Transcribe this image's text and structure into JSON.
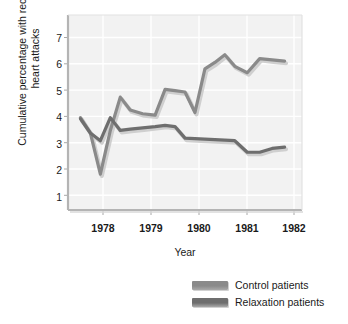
{
  "chart_data": {
    "type": "line",
    "title": "",
    "xlabel": "Year",
    "ylabel": "Cumulative percentage with recurrent heart attacks",
    "xlim": [
      1977.75,
      1982.45
    ],
    "ylim": [
      0,
      7.6
    ],
    "xticks": [
      "1978",
      "1979",
      "1980",
      "1981",
      "1982"
    ],
    "xtick_values": [
      1978,
      1979,
      1980,
      1981,
      1982
    ],
    "yticks": [
      "1",
      "2",
      "3",
      "4",
      "5",
      "6",
      "7"
    ],
    "ytick_values": [
      1,
      2,
      3,
      4,
      5,
      6,
      7
    ],
    "grid": true,
    "legend_position": "bottom",
    "x": [
      1978.0,
      1978.2,
      1978.4,
      1978.6,
      1978.8,
      1979.0,
      1979.25,
      1979.5,
      1979.7,
      1979.9,
      1980.1,
      1980.3,
      1980.5,
      1980.7,
      1980.9,
      1981.1,
      1981.35,
      1981.6,
      1981.85,
      1982.1
    ],
    "series": [
      {
        "name": "Control patients",
        "color": "#8a8a8a",
        "values": [
          3.6,
          3.0,
          1.4,
          3.1,
          4.4,
          3.9,
          3.75,
          3.7,
          4.7,
          4.65,
          4.6,
          3.8,
          5.5,
          5.75,
          6.05,
          5.6,
          5.35,
          5.9,
          5.85,
          5.8
        ]
      },
      {
        "name": "Relaxation patients",
        "color": "#6e6e6e",
        "values": [
          3.55,
          3.0,
          2.7,
          3.6,
          3.1,
          3.15,
          3.2,
          3.25,
          3.3,
          3.25,
          2.8,
          2.78,
          2.76,
          2.74,
          2.72,
          2.7,
          2.25,
          2.25,
          2.4,
          2.45
        ]
      }
    ]
  },
  "legend": {
    "items": [
      {
        "label": "Control patients",
        "color": "#8a8a8a"
      },
      {
        "label": "Relaxation patients",
        "color": "#6e6e6e"
      }
    ]
  },
  "style": {
    "plot_background": "#f2f2f2",
    "grid_color": "#ffffff",
    "axis_color": "#b4b4b4",
    "text_color": "#1a1a1a"
  }
}
